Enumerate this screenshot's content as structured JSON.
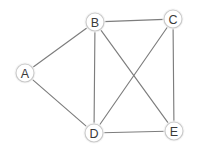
{
  "diagram": {
    "type": "node-link-graph",
    "width": 198,
    "height": 157,
    "background_color": "#ffffff",
    "node_fill_color": "#ffffff",
    "node_stroke_color": "#c9c9c9",
    "node_halo_color": "#f3f3f3",
    "node_radius": 9,
    "label_color": "#3a3a3a",
    "edge_color": "#7d7d7d",
    "edge_width": 1.15,
    "nodes": [
      {
        "id": "A",
        "label": "A",
        "x": 25,
        "y": 73
      },
      {
        "id": "B",
        "label": "B",
        "x": 95,
        "y": 22
      },
      {
        "id": "C",
        "label": "C",
        "x": 173,
        "y": 19
      },
      {
        "id": "D",
        "label": "D",
        "x": 94,
        "y": 133
      },
      {
        "id": "E",
        "label": "E",
        "x": 174,
        "y": 131
      }
    ],
    "edges": [
      {
        "id": "A-B",
        "from": "A",
        "to": "B"
      },
      {
        "id": "A-D",
        "from": "A",
        "to": "D"
      },
      {
        "id": "B-C",
        "from": "B",
        "to": "C"
      },
      {
        "id": "B-D",
        "from": "B",
        "to": "D"
      },
      {
        "id": "B-E",
        "from": "B",
        "to": "E"
      },
      {
        "id": "C-D",
        "from": "C",
        "to": "D"
      },
      {
        "id": "C-E",
        "from": "C",
        "to": "E"
      },
      {
        "id": "D-E",
        "from": "D",
        "to": "E"
      }
    ]
  }
}
